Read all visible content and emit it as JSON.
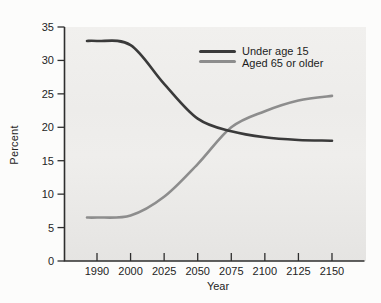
{
  "chart_data": {
    "type": "line",
    "title": "",
    "xlabel": "Year",
    "ylabel": "Percent",
    "categories": [
      "1990",
      "2000",
      "2025",
      "2050",
      "2075",
      "2100",
      "2125",
      "2150"
    ],
    "y_ticks": [
      0,
      5,
      10,
      15,
      20,
      25,
      30,
      35
    ],
    "ylim": [
      0,
      35
    ],
    "grid": false,
    "legend_position": "inside-top-right",
    "x_axis_note": "ticks evenly spaced (not linear in year)",
    "series": [
      {
        "name": "Under age 15",
        "color": "#3a3a3a",
        "values": [
          32.9,
          32.3,
          26.5,
          21.3,
          19.4,
          18.5,
          18.1,
          18.0
        ]
      },
      {
        "name": "Aged 65 or older",
        "color": "#8d8d8d",
        "values": [
          6.5,
          6.8,
          9.6,
          14.5,
          20.0,
          22.4,
          24.0,
          24.7
        ]
      }
    ]
  },
  "colors": {
    "axis": "#2e2e2e",
    "tick_text": "#242424",
    "plot_bg_top": "#f1f0ee",
    "plot_bg_bottom": "#e5e4e2",
    "page_bg": "#fcfcfb"
  }
}
